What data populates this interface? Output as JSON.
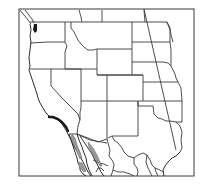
{
  "map": {
    "title": "",
    "region": "Western United States and northern Mexico",
    "style": "black-and-white line map of state boundaries",
    "features": [
      {
        "name": "state-boundaries",
        "description": "Western US state outlines"
      },
      {
        "name": "meridian-line",
        "description": "Diagonal longitude line through Great Plains"
      },
      {
        "name": "highlighted-coast",
        "description": "Dark band along southern California coast"
      },
      {
        "name": "shaded-gulf-region",
        "description": "Gray shaded area along Baja California / Gulf of California"
      }
    ],
    "colors": {
      "line": "#3a3a3a",
      "highlight_dark": "#1a1a1a",
      "highlight_gray": "#9a9a9a",
      "background": "#ffffff"
    }
  }
}
